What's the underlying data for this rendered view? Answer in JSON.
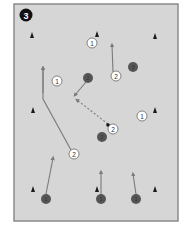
{
  "diagram": {
    "step_number": "3",
    "colors": {
      "field_bg": "#d4d4d4",
      "frame": "#8a8a8a",
      "player_dark": "#555555",
      "line": "#7a7a7a",
      "cone": "#1a1a1a"
    },
    "cones": [
      {
        "x": 32,
        "y": 35
      },
      {
        "x": 97,
        "y": 34
      },
      {
        "x": 155,
        "y": 36
      },
      {
        "x": 33,
        "y": 110
      },
      {
        "x": 155,
        "y": 110
      },
      {
        "x": 33,
        "y": 189
      },
      {
        "x": 97,
        "y": 189
      },
      {
        "x": 155,
        "y": 189
      }
    ],
    "markers": [
      {
        "label": "1",
        "x": 92,
        "y": 43
      },
      {
        "label": "2",
        "x": 116,
        "y": 76
      },
      {
        "label": "1",
        "x": 57,
        "y": 81
      },
      {
        "label": "1",
        "x": 142,
        "y": 116
      },
      {
        "label": "2",
        "x": 113,
        "y": 128
      },
      {
        "label": "2",
        "x": 74,
        "y": 154
      }
    ],
    "players_dark": [
      {
        "label": "2",
        "x": 88,
        "y": 78
      },
      {
        "label": "3",
        "x": 133,
        "y": 67
      },
      {
        "label": "2",
        "x": 102,
        "y": 137
      },
      {
        "label": "1",
        "x": 46,
        "y": 199
      },
      {
        "label": "1",
        "x": 101,
        "y": 199
      },
      {
        "label": "1",
        "x": 136,
        "y": 199
      }
    ]
  }
}
